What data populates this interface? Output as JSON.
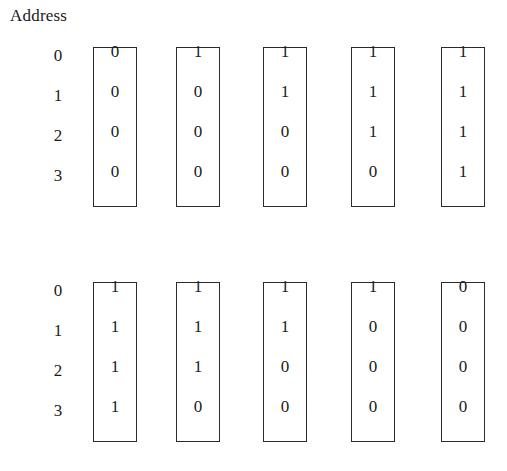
{
  "diagram": {
    "caption": "Address",
    "addresses": [
      "0",
      "1",
      "2",
      "3"
    ],
    "banks": [
      {
        "name": "top-bank",
        "addresses": [
          "0",
          "1",
          "2",
          "3"
        ],
        "columns": [
          {
            "name": "column-1",
            "bits": [
              "0",
              "0",
              "0",
              "0"
            ]
          },
          {
            "name": "column-2",
            "bits": [
              "1",
              "0",
              "0",
              "0"
            ]
          },
          {
            "name": "column-3",
            "bits": [
              "1",
              "1",
              "0",
              "0"
            ]
          },
          {
            "name": "column-4",
            "bits": [
              "1",
              "1",
              "1",
              "0"
            ]
          },
          {
            "name": "column-5",
            "bits": [
              "1",
              "1",
              "1",
              "1"
            ]
          }
        ]
      },
      {
        "name": "bottom-bank",
        "addresses": [
          "0",
          "1",
          "2",
          "3"
        ],
        "columns": [
          {
            "name": "column-1",
            "bits": [
              "1",
              "1",
              "1",
              "1"
            ]
          },
          {
            "name": "column-2",
            "bits": [
              "1",
              "1",
              "1",
              "0"
            ]
          },
          {
            "name": "column-3",
            "bits": [
              "1",
              "1",
              "0",
              "0"
            ]
          },
          {
            "name": "column-4",
            "bits": [
              "1",
              "0",
              "0",
              "0"
            ]
          },
          {
            "name": "column-5",
            "bits": [
              "0",
              "0",
              "0",
              "0"
            ]
          }
        ]
      }
    ],
    "colors": {
      "background": "#ffffff",
      "border": "#2b2b2b",
      "text": "#1a1a1a"
    }
  }
}
